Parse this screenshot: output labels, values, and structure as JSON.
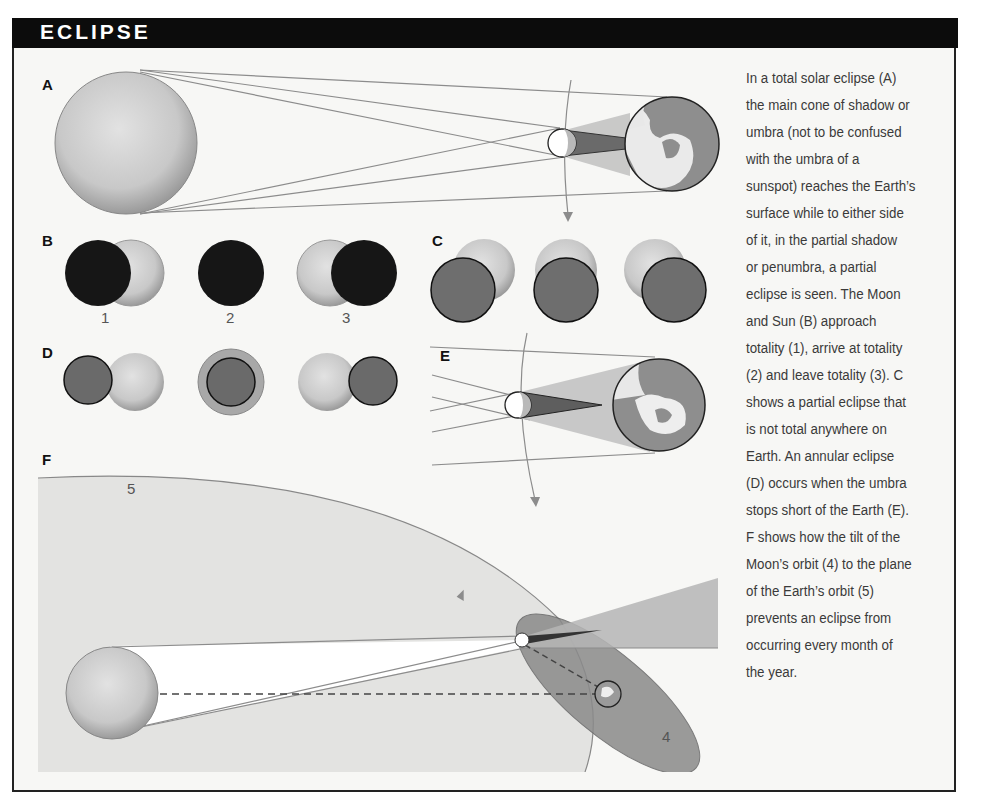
{
  "header": {
    "title": "ECLIPSE"
  },
  "panels": {
    "A": {
      "label": "A"
    },
    "B": {
      "label": "B",
      "stages": [
        "1",
        "2",
        "3"
      ]
    },
    "C": {
      "label": "C"
    },
    "D": {
      "label": "D"
    },
    "E": {
      "label": "E"
    },
    "F": {
      "label": "F",
      "orbit_labels": {
        "earth_orbit": "5",
        "moon_orbit": "4"
      }
    }
  },
  "caption": {
    "lines": [
      "In a total solar eclipse (A)",
      "the main cone of shadow or",
      "umbra (not to be confused",
      "with the umbra of a",
      "sunspot) reaches the Earth’s",
      "surface while to either side",
      "of it, in the partial shadow",
      "or penumbra, a partial",
      "eclipse is seen. The Moon",
      "and Sun (B) approach",
      "totality (1), arrive at totality",
      "(2) and leave totality (3). C",
      "shows a partial eclipse that",
      "is not total anywhere on",
      "Earth. An annular eclipse",
      "(D) occurs when the umbra",
      "stops short of the Earth (E).",
      "F shows how the tilt of the",
      "Moon’s orbit (4) to the plane",
      "of the Earth’s orbit (5)",
      "prevents an eclipse from",
      "occurring every month of",
      "the year."
    ]
  },
  "colors": {
    "header_bg": "#0c0c0c",
    "sun": "#c9c9c9",
    "moon_dark": "#1a1a1a",
    "moon_grey": "#6e6e6e",
    "earth_orbit_plane": "#e3e3e1",
    "moon_orbit_plane": "#8a8a8a",
    "umbra": "#6a6a6a",
    "penumbra": "#b8b8b8",
    "line": "#8c8c8c"
  }
}
